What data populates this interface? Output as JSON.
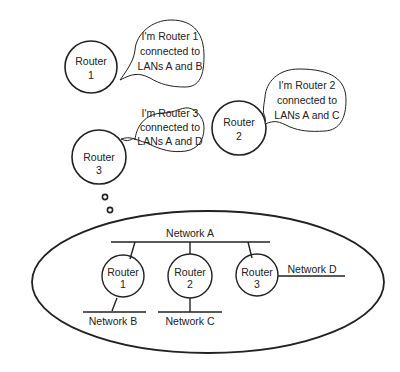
{
  "bubbles": {
    "r1": [
      "I'm Router 1",
      "connected to",
      "LANs A and B"
    ],
    "r2": [
      "I'm Router 2",
      "connected to",
      "LANs A and C"
    ],
    "r3": [
      "I'm Router 3",
      "connected to",
      "LANs A and D"
    ]
  },
  "top_routers": {
    "r1": [
      "Router",
      "1"
    ],
    "r2": [
      "Router",
      "2"
    ],
    "r3": [
      "Router",
      "3"
    ]
  },
  "network_routers": {
    "r1": [
      "Router",
      "1"
    ],
    "r2": [
      "Router",
      "2"
    ],
    "r3": [
      "Router",
      "3"
    ]
  },
  "networks": {
    "a": "Network A",
    "b": "Network B",
    "c": "Network C",
    "d": "Network D"
  },
  "colors": {
    "stroke": "#222222",
    "background": "#ffffff"
  }
}
